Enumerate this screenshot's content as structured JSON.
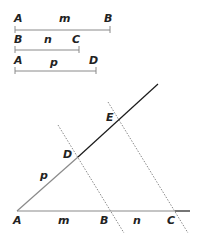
{
  "colors": {
    "gray_line": "#8a8a8a",
    "black_line": "#1a1a1a",
    "dotted": "#8a8a8a",
    "text": "#222222"
  },
  "segments": [
    {
      "name": "m",
      "start_label": "A",
      "end_label": "B",
      "length_label": "m"
    },
    {
      "name": "n",
      "start_label": "B",
      "end_label": "C",
      "length_label": "n"
    },
    {
      "name": "p",
      "start_label": "A",
      "end_label": "D",
      "length_label": "p"
    }
  ],
  "construction": {
    "points": {
      "A": "A",
      "B": "B",
      "C": "C",
      "D": "D",
      "E": "E"
    },
    "base_labels": {
      "m": "m",
      "n": "n"
    },
    "ray_labels": {
      "p": "p"
    }
  }
}
